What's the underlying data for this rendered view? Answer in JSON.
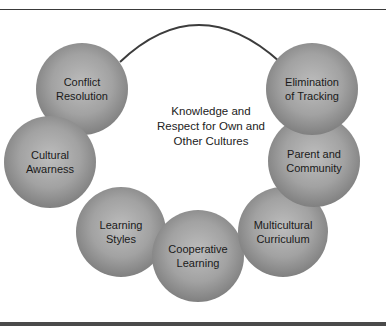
{
  "diagram": {
    "center_label": "Knowledge and Respect for Own and Other Cultures",
    "center_lines": [
      "Knowledge and",
      "Respect for Own and",
      "Other Cultures"
    ],
    "nodes": [
      {
        "id": "conflict-resolution",
        "lines": [
          "Conflict",
          "Resolution"
        ],
        "cx": 82,
        "cy": 89,
        "r": 46
      },
      {
        "id": "cultural-awarness",
        "lines": [
          "Cultural",
          "Awarness"
        ],
        "cx": 50,
        "cy": 162,
        "r": 46
      },
      {
        "id": "learning-styles",
        "lines": [
          "Learning",
          "Styles"
        ],
        "cx": 121,
        "cy": 232,
        "r": 45
      },
      {
        "id": "cooperative-learning",
        "lines": [
          "Cooperative",
          "Learning"
        ],
        "cx": 198,
        "cy": 256,
        "r": 46
      },
      {
        "id": "multicultural-curriculum",
        "lines": [
          "Multicultural",
          "Curriculum"
        ],
        "cx": 283,
        "cy": 232,
        "r": 45
      },
      {
        "id": "parent-and-community",
        "lines": [
          "Parent and",
          "Community"
        ],
        "cx": 314,
        "cy": 161,
        "r": 46
      },
      {
        "id": "elimination-of-tracking",
        "lines": [
          "Elimination",
          "of Tracking"
        ],
        "cx": 312,
        "cy": 89,
        "r": 46
      }
    ],
    "colors": {
      "sphere_light": "#b8b8b8",
      "sphere_mid": "#9a9a9a",
      "sphere_dark": "#7a7a7a",
      "arc": "#3c3c3c",
      "rule": "#3a3a3a"
    }
  }
}
